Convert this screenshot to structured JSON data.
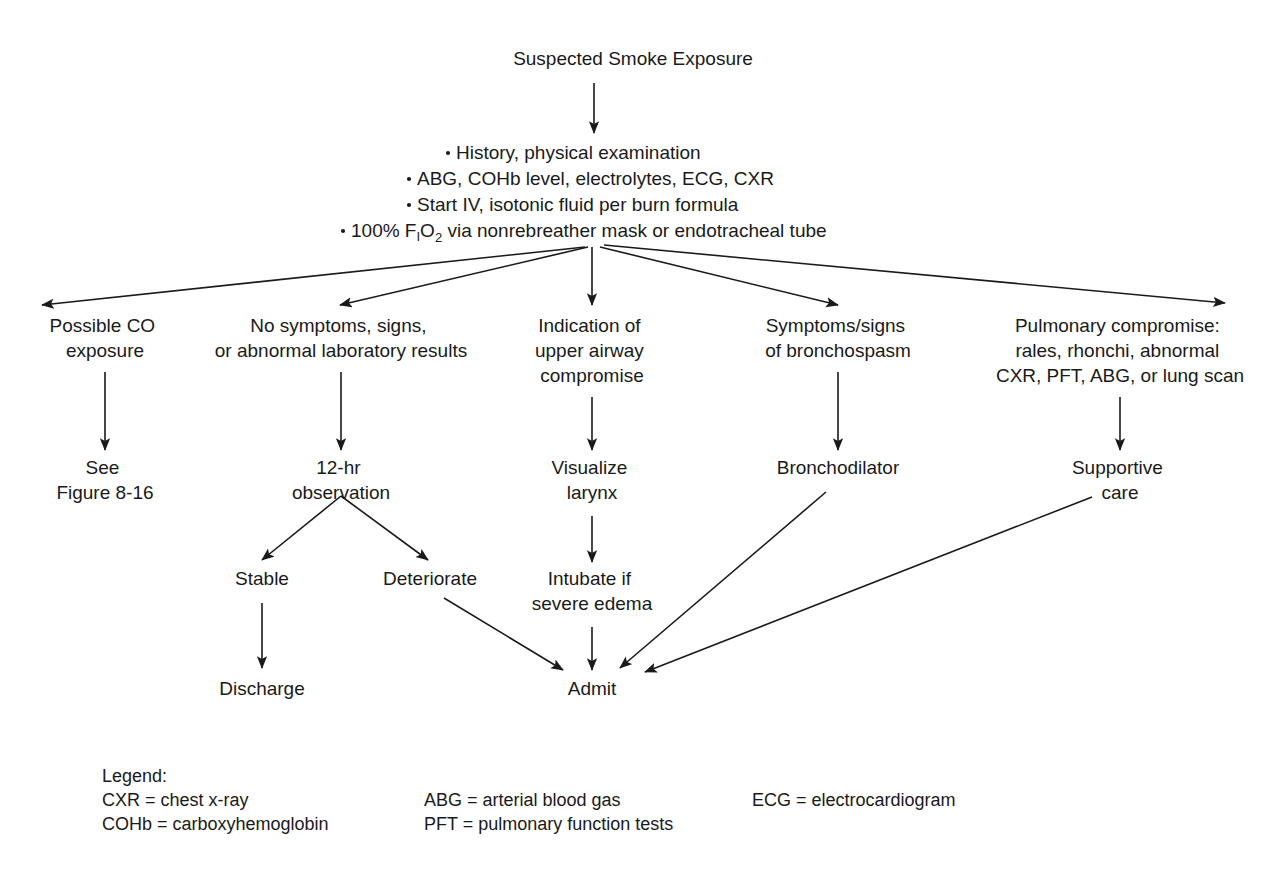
{
  "diagram": {
    "title_node": "Suspected Smoke Exposure",
    "initial_workup": {
      "bullets": [
        "History, physical examination",
        "ABG, COHb level, electrolytes, ECG, CXR",
        "Start IV, isotonic fluid per burn formula",
        "100% FIO2 via nonrebreather mask or endotracheal tube"
      ],
      "bullet4_parts": {
        "pre": "100% F",
        "sub1": "I",
        "mid": "O",
        "sub2": "2",
        "post": " via nonrebreather mask or endotracheal tube"
      }
    },
    "branches": [
      {
        "id": "branch-possible-co-exposure",
        "lines": [
          "Possible CO",
          "exposure"
        ],
        "next": {
          "id": "node-see-figure",
          "lines": [
            "See",
            "Figure 8-16"
          ]
        }
      },
      {
        "id": "branch-no-symptoms",
        "lines": [
          "No symptoms, signs,",
          "or abnormal laboratory results"
        ],
        "next": {
          "id": "node-observation",
          "lines": [
            "12-hr",
            "observation"
          ]
        }
      },
      {
        "id": "branch-upper-airway",
        "lines": [
          "Indication of",
          "upper airway",
          "compromise"
        ],
        "next": {
          "id": "node-visualize-larynx",
          "lines": [
            "Visualize",
            "larynx"
          ]
        }
      },
      {
        "id": "branch-bronchospasm",
        "lines": [
          "Symptoms/signs",
          "of bronchospasm"
        ],
        "next": {
          "id": "node-bronchodilator",
          "lines": [
            "Bronchodilator"
          ]
        }
      },
      {
        "id": "branch-pulmonary-compromise",
        "lines": [
          "Pulmonary compromise:",
          "rales, rhonchi, abnormal",
          "CXR, PFT, ABG, or lung scan"
        ],
        "next": {
          "id": "node-supportive-care",
          "lines": [
            "Supportive",
            "care"
          ]
        }
      }
    ],
    "outcome_nodes": [
      {
        "id": "node-stable",
        "lines": [
          "Stable"
        ]
      },
      {
        "id": "node-deteriorate",
        "lines": [
          "Deteriorate"
        ]
      },
      {
        "id": "node-intubate",
        "lines": [
          "Intubate if",
          "severe edema"
        ]
      }
    ],
    "terminal_nodes": [
      {
        "id": "node-discharge",
        "lines": [
          "Discharge"
        ]
      },
      {
        "id": "node-admit",
        "lines": [
          "Admit"
        ]
      }
    ]
  },
  "legend": {
    "heading": "Legend:",
    "column1": [
      "CXR = chest x-ray",
      "COHb = carboxyhemoglobin"
    ],
    "column2": [
      "ABG = arterial blood gas",
      "PFT = pulmonary function tests"
    ],
    "column3": [
      "ECG = electrocardiogram"
    ]
  },
  "colors": {
    "text": "#1a1a1a",
    "stroke": "#1a1a1a",
    "background": "#ffffff"
  }
}
